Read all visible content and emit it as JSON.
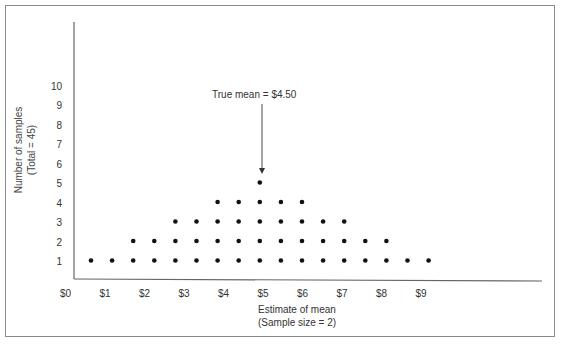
{
  "chart_data": {
    "type": "scatter",
    "subtype": "dot-plot",
    "title": "",
    "xlabel": "Estimate of mean",
    "xlabel_sub": "(Sample size = 2)",
    "ylabel": "Number of samples",
    "ylabel_sub": "(Total = 45)",
    "x_ticks": [
      "$0",
      "$1",
      "$2",
      "$3",
      "$4",
      "$5",
      "$6",
      "$7",
      "$8",
      "$9"
    ],
    "y_ticks": [
      "1",
      "2",
      "3",
      "4",
      "5",
      "6",
      "7",
      "8",
      "9",
      "10"
    ],
    "xlim": [
      0,
      9
    ],
    "ylim": [
      0,
      10
    ],
    "grid": false,
    "annotation": {
      "text": "True mean  =  $4.50",
      "x": 4.5
    },
    "x": [
      0.5,
      1.0,
      1.5,
      2.0,
      2.5,
      3.0,
      3.5,
      4.0,
      4.5,
      5.0,
      5.5,
      6.0,
      6.5,
      7.0,
      7.5,
      8.0,
      8.5
    ],
    "counts": [
      1,
      1,
      2,
      2,
      3,
      3,
      4,
      4,
      5,
      4,
      4,
      3,
      3,
      2,
      2,
      1,
      1
    ],
    "total": 45
  },
  "labels": {
    "annotation": "True mean  =  $4.50",
    "xlabel": "Estimate of mean",
    "xlabel_sub": "(Sample size = 2)",
    "ylabel": "Number of samples",
    "ylabel_sub": "(Total = 45)"
  }
}
